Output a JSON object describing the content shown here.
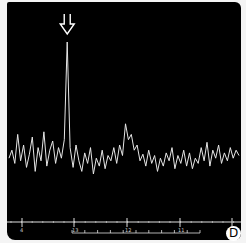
{
  "panel_label": "D",
  "marker": {
    "type": "arrow-down",
    "x_index": 20
  },
  "chart_data": {
    "type": "line",
    "title": "",
    "xlabel": "",
    "ylabel": "",
    "grid": false,
    "legend": "none",
    "background": "#000000",
    "line_color": "#e6e6e6",
    "x": [
      0,
      1,
      2,
      3,
      4,
      5,
      6,
      7,
      8,
      9,
      10,
      11,
      12,
      13,
      14,
      15,
      16,
      17,
      18,
      19,
      20,
      21,
      22,
      23,
      24,
      25,
      26,
      27,
      28,
      29,
      30,
      31,
      32,
      33,
      34,
      35,
      36,
      37,
      38,
      39,
      40,
      41,
      42,
      43,
      44,
      45,
      46,
      47,
      48,
      49,
      50,
      51,
      52,
      53,
      54,
      55,
      56,
      57,
      58,
      59,
      60,
      61,
      62,
      63,
      64,
      65,
      66,
      67,
      68,
      69,
      70,
      71,
      72,
      73,
      74,
      75,
      76,
      77,
      78,
      79
    ],
    "values": [
      0.12,
      0.18,
      0.08,
      0.3,
      0.1,
      0.22,
      0.05,
      0.15,
      0.28,
      0.02,
      0.2,
      0.1,
      0.32,
      0.06,
      0.18,
      0.25,
      0.08,
      0.2,
      0.12,
      0.26,
      1.0,
      0.2,
      0.05,
      0.22,
      0.1,
      0.02,
      0.16,
      0.08,
      0.2,
      0.0,
      0.12,
      0.06,
      0.18,
      0.04,
      0.14,
      0.1,
      0.2,
      0.08,
      0.22,
      0.14,
      0.38,
      0.26,
      0.3,
      0.18,
      0.22,
      0.1,
      0.15,
      0.06,
      0.18,
      0.08,
      0.14,
      0.02,
      0.12,
      0.06,
      0.16,
      0.1,
      0.2,
      0.04,
      0.14,
      0.08,
      0.18,
      0.06,
      0.16,
      0.04,
      0.12,
      0.08,
      0.2,
      0.1,
      0.24,
      0.06,
      0.18,
      0.12,
      0.22,
      0.08,
      0.16,
      0.1,
      0.2,
      0.12,
      0.18,
      0.14
    ],
    "peak": {
      "x_index": 20,
      "value": 1.0
    },
    "secondary_peak": {
      "x_index": 40,
      "value": 0.38
    },
    "axis": {
      "major_ticks": 5,
      "sub_scale_ticks": 11,
      "tick_labels": [
        "4",
        "13",
        "12",
        "11",
        ""
      ]
    }
  }
}
